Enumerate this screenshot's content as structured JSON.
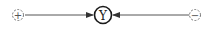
{
  "diagram": {
    "nodes": [
      {
        "id": "positive",
        "symbol": "+",
        "style": "dashed-circle"
      },
      {
        "id": "center",
        "symbol": "Υ",
        "style": "solid-circle"
      },
      {
        "id": "negative",
        "symbol": "−",
        "style": "dashed-circle"
      }
    ],
    "edges": [
      {
        "from": "positive",
        "to": "center",
        "direction": "right"
      },
      {
        "from": "negative",
        "to": "center",
        "direction": "left"
      }
    ],
    "colors": {
      "stroke": "#222222",
      "dashed": "#777777",
      "background": "#ffffff"
    }
  }
}
